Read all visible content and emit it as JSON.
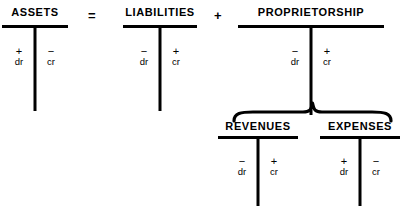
{
  "diagram": {
    "background_color": "#ffffff",
    "ink_color": "#000000"
  },
  "operators": {
    "equals": "=",
    "plus": "+"
  },
  "signs": {
    "plus": "+",
    "minus": "−"
  },
  "labels": {
    "debit": "dr",
    "credit": "cr"
  },
  "accounts": [
    {
      "id": "assets",
      "name": "ASSETS",
      "left": {
        "sign": "+",
        "entry": "dr"
      },
      "right": {
        "sign": "−",
        "entry": "cr"
      }
    },
    {
      "id": "liabilities",
      "name": "LIABILITIES",
      "left": {
        "sign": "−",
        "entry": "dr"
      },
      "right": {
        "sign": "+",
        "entry": "cr"
      }
    },
    {
      "id": "proprietorship",
      "name": "PROPRIETORSHIP",
      "left": {
        "sign": "−",
        "entry": "dr"
      },
      "right": {
        "sign": "+",
        "entry": "cr"
      }
    },
    {
      "id": "revenues",
      "name": "REVENUES",
      "left": {
        "sign": "−",
        "entry": "dr"
      },
      "right": {
        "sign": "+",
        "entry": "cr"
      }
    },
    {
      "id": "expenses",
      "name": "EXPENSES",
      "left": {
        "sign": "+",
        "entry": "dr"
      },
      "right": {
        "sign": "−",
        "entry": "cr"
      }
    }
  ]
}
